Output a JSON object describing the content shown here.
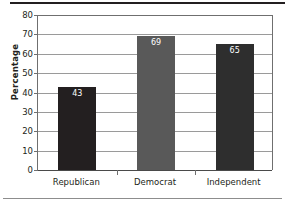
{
  "chart_data": {
    "type": "bar",
    "title": "",
    "xlabel": "",
    "ylabel": "Percentage",
    "categories": [
      "Republican",
      "Democrat",
      "Independent"
    ],
    "values": [
      43,
      69,
      65
    ],
    "bar_colors": [
      "#231f20",
      "#595959",
      "#2e2e2e"
    ],
    "value_label_color": "#ffffff",
    "ylim": [
      0,
      80
    ],
    "yticks": [
      0,
      10,
      20,
      30,
      40,
      50,
      60,
      70,
      80
    ],
    "ytick_labels": [
      "0",
      "10",
      "20",
      "30",
      "40",
      "50",
      "60",
      "70",
      "80"
    ],
    "grid": true,
    "grid_axis": "y",
    "legend": false,
    "legend_position": "none",
    "value_labels": [
      "43",
      "69",
      "65"
    ]
  },
  "axis": {
    "y_title": "Percentage",
    "y_ticks": [
      {
        "label": "80",
        "value": 80
      },
      {
        "label": "70",
        "value": 70
      },
      {
        "label": "60",
        "value": 60
      },
      {
        "label": "50",
        "value": 50
      },
      {
        "label": "40",
        "value": 40
      },
      {
        "label": "30",
        "value": 30
      },
      {
        "label": "20",
        "value": 20
      },
      {
        "label": "10",
        "value": 10
      },
      {
        "label": "0",
        "value": 0
      }
    ],
    "x_categories": [
      "Republican",
      "Democrat",
      "Independent"
    ]
  },
  "bars": [
    {
      "category": "Republican",
      "value": 43,
      "value_label": "43",
      "color": "#231f20"
    },
    {
      "category": "Democrat",
      "value": 69,
      "value_label": "69",
      "color": "#595959"
    },
    {
      "category": "Independent",
      "value": 65,
      "value_label": "65",
      "color": "#2e2e2e"
    }
  ],
  "colors": {
    "grid": "#9a9a9a",
    "frame": "#6f6f6f",
    "text": "#231f20",
    "rule_top": "#231f20",
    "rule_bottom": "#8d8d8d"
  }
}
